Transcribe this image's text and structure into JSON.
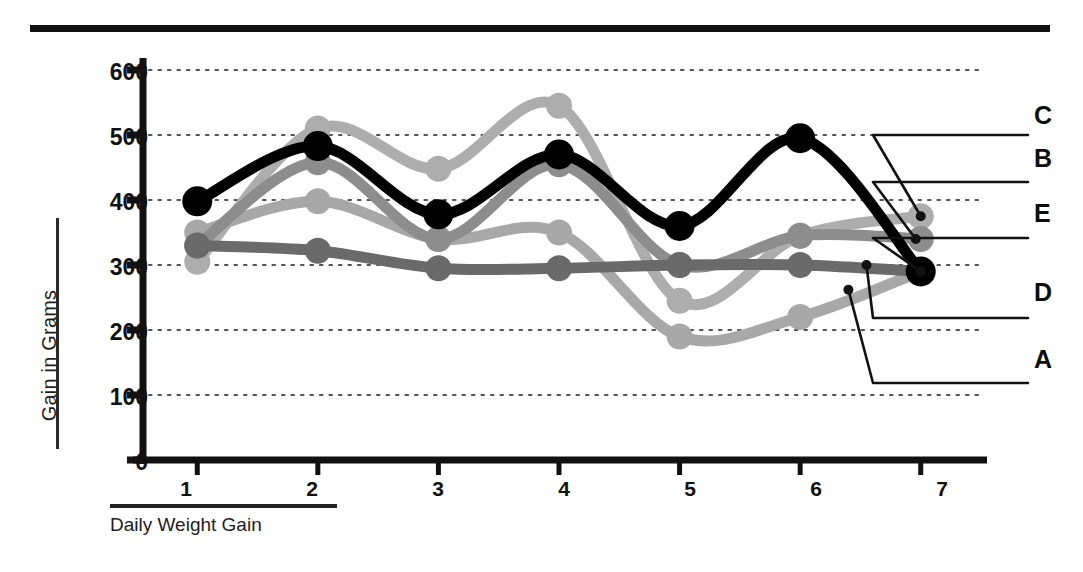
{
  "figure": {
    "background": "#ffffff",
    "top_rule_color": "#111111",
    "axis_color": "#111111",
    "grid_color": "#555555"
  },
  "axes": {
    "y_title": "Gain in Grams",
    "x_title": "Daily Weight Gain",
    "y_ticks": [
      "0",
      "100",
      "200",
      "300",
      "400",
      "500",
      "600"
    ],
    "x_ticks": [
      "1",
      "2",
      "3",
      "4",
      "5",
      "6",
      "7"
    ]
  },
  "legend": {
    "labels": [
      "C",
      "B",
      "E",
      "D",
      "A"
    ],
    "items": [
      {
        "label": "C",
        "series": "C",
        "color": "#adadad"
      },
      {
        "label": "B",
        "series": "B",
        "color": "#8d8d8d"
      },
      {
        "label": "E",
        "series": "E",
        "color": "#000000"
      },
      {
        "label": "D",
        "series": "D",
        "color": "#6a6a6a"
      },
      {
        "label": "A",
        "series": "A",
        "color": "#a8a8a8"
      }
    ]
  },
  "chart_data": {
    "type": "line",
    "title": "",
    "xlabel": "Daily Weight Gain",
    "ylabel": "Gain in Grams",
    "x": [
      1,
      2,
      3,
      4,
      5,
      6,
      7
    ],
    "xlim": [
      0.55,
      7.45
    ],
    "ylim": [
      0,
      600
    ],
    "y_ticks": [
      0,
      100,
      200,
      300,
      400,
      500,
      600
    ],
    "grid": "horizontal-dotted",
    "legend_position": "right-callouts",
    "series": [
      {
        "name": "E",
        "color": "#000000",
        "width": 11,
        "marker": 15,
        "values": [
          398,
          483,
          378,
          470,
          360,
          495,
          290
        ]
      },
      {
        "name": "C",
        "color": "#adadad",
        "width": 11,
        "marker": 13,
        "values": [
          305,
          510,
          448,
          545,
          245,
          345,
          375
        ]
      },
      {
        "name": "B",
        "color": "#8d8d8d",
        "width": 11,
        "marker": 13,
        "values": [
          330,
          458,
          340,
          455,
          300,
          345,
          340
        ]
      },
      {
        "name": "A",
        "color": "#a8a8a8",
        "width": 11,
        "marker": 13,
        "values": [
          350,
          398,
          340,
          350,
          190,
          220,
          290
        ]
      },
      {
        "name": "D",
        "color": "#6a6a6a",
        "width": 11,
        "marker": 13,
        "values": [
          330,
          322,
          295,
          295,
          300,
          300,
          290
        ]
      }
    ]
  }
}
